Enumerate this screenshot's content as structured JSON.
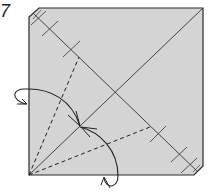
{
  "diagram": {
    "step_number": "7",
    "paper_color": "#d4d4d4",
    "edge_color": "#2a2a2a",
    "elements": [
      {
        "type": "square-paper",
        "description": "square sheet with beveled top-left and bottom-right corners"
      },
      {
        "type": "crease",
        "description": "diagonal from bottom-left to top-right"
      },
      {
        "type": "crease",
        "description": "diagonal from top-left to bottom-right with tick marks"
      },
      {
        "type": "valley-fold-line",
        "description": "dashed line from bottom-left corner up to upper-left diagonal mark"
      },
      {
        "type": "valley-fold-line",
        "description": "dashed line from bottom-left corner to right diagonal mark"
      },
      {
        "type": "fold-arrow",
        "description": "curved arrow from left edge to diagonal point"
      },
      {
        "type": "fold-arrow",
        "description": "curved arrow from bottom edge to diagonal point"
      }
    ]
  }
}
